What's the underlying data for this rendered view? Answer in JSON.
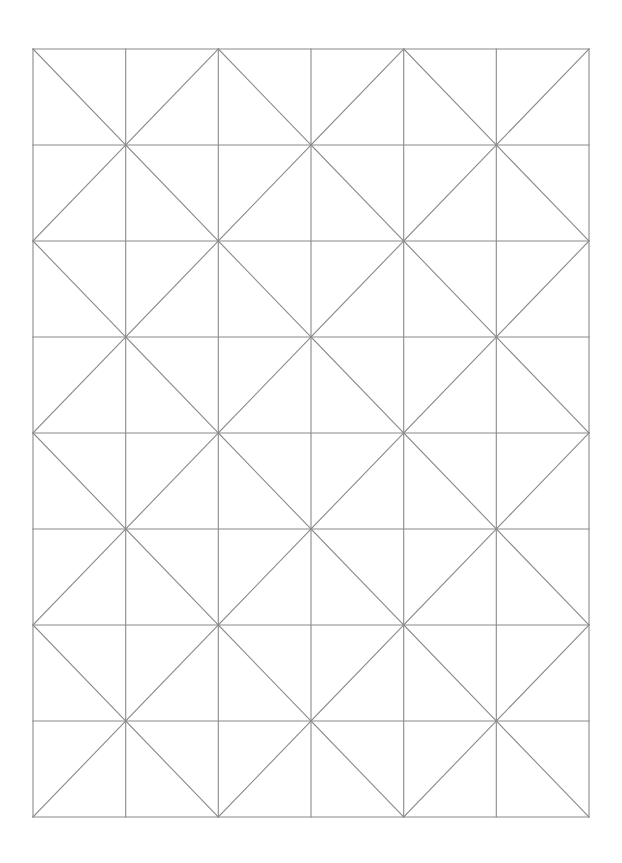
{
  "canvas": {
    "width": 622,
    "height": 863,
    "background": "#ffffff"
  },
  "grid": {
    "type": "triangle-diamond-grid",
    "columns": 6,
    "rows": 8,
    "x_lines": [
      33,
      125.7,
      218.3,
      311,
      403.7,
      496.3,
      589
    ],
    "y_lines": [
      49,
      145,
      241,
      337,
      433,
      529,
      625,
      721,
      817
    ],
    "line_color": "#8a8a8a",
    "line_width": 1.1,
    "diagonal_rule": "cell (row r, col c): backslash (top-left to bottom-right) when (r+c) is even, slash (bottom-left to top-right) when odd",
    "cells": [
      [
        "\\",
        "/",
        "\\",
        "/",
        "\\",
        "/"
      ],
      [
        "/",
        "\\",
        "/",
        "\\",
        "/",
        "\\"
      ],
      [
        "\\",
        "/",
        "\\",
        "/",
        "\\",
        "/"
      ],
      [
        "/",
        "\\",
        "/",
        "\\",
        "/",
        "\\"
      ],
      [
        "\\",
        "/",
        "\\",
        "/",
        "\\",
        "/"
      ],
      [
        "/",
        "\\",
        "/",
        "\\",
        "/",
        "\\"
      ],
      [
        "\\",
        "/",
        "\\",
        "/",
        "\\",
        "/"
      ],
      [
        "/",
        "\\",
        "/",
        "\\",
        "/",
        "\\"
      ]
    ]
  }
}
